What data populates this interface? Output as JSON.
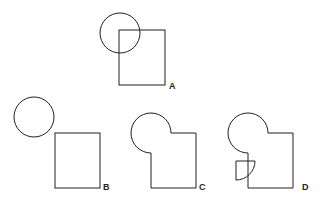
{
  "page": {
    "background_color": "#ffffff",
    "stroke_color": "#231f20",
    "stroke_width": 1,
    "width": 328,
    "height": 206
  },
  "figures": [
    {
      "id": "A",
      "label": "A",
      "label_x": 169,
      "label_y": 89,
      "description": "Full circle overlapping the top-left corner of a rectangle; both outlines drawn complete",
      "shapes": [
        {
          "kind": "circle",
          "name": "circle-a",
          "cx": 120,
          "cy": 33,
          "r": 20,
          "removed_wedge": null
        },
        {
          "kind": "rect",
          "name": "rect-a",
          "x": 119,
          "y": 30,
          "width": 46,
          "height": 55
        }
      ]
    },
    {
      "id": "B",
      "label": "B",
      "label_x": 103,
      "label_y": 190,
      "description": "Circle and rectangle fully separated, no contact",
      "shapes": [
        {
          "kind": "circle",
          "name": "circle-b",
          "cx": 34,
          "cy": 117,
          "r": 20,
          "removed_wedge": null
        },
        {
          "kind": "rect",
          "name": "rect-b",
          "x": 55,
          "y": 133,
          "width": 45,
          "height": 55
        }
      ]
    },
    {
      "id": "C",
      "label": "C",
      "label_x": 199,
      "label_y": 190,
      "description": "Pac-man circle (lower-right quarter removed) merged with rectangle; union outline, rectangle top-left corner replaced by circle arc",
      "shapes": [
        {
          "kind": "pacman-circle",
          "name": "pacman-c",
          "cx": 151,
          "cy": 133,
          "r": 20,
          "removed_wedge": {
            "start_angle_deg": 0,
            "end_angle_deg": 90
          }
        },
        {
          "kind": "rect",
          "name": "rect-c",
          "x": 151,
          "y": 133,
          "width": 45,
          "height": 55
        }
      ],
      "union_outline": true
    },
    {
      "id": "D",
      "label": "D",
      "label_x": 302,
      "label_y": 190,
      "description": "Same union as C, plus the removed quarter wedge drawn detached below-left",
      "shapes": [
        {
          "kind": "pacman-circle",
          "name": "pacman-d",
          "cx": 248,
          "cy": 133,
          "r": 20,
          "removed_wedge": {
            "start_angle_deg": 0,
            "end_angle_deg": 90
          }
        },
        {
          "kind": "rect",
          "name": "rect-d",
          "x": 248,
          "y": 133,
          "width": 45,
          "height": 55
        },
        {
          "kind": "quarter-wedge",
          "name": "wedge-d",
          "corner_x": 236,
          "corner_y": 161,
          "r": 19,
          "orientation": "corner-top-left-arc-bottom-right"
        }
      ],
      "union_outline": true
    }
  ]
}
